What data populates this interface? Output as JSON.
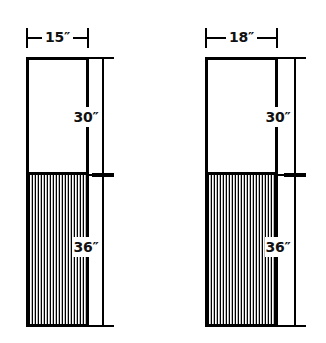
{
  "diagram": {
    "unit_symbol": "″",
    "colors": {
      "outline": "#000000",
      "background": "#ffffff",
      "hatch_dark": "#000000",
      "hatch_light": "#ffffff"
    },
    "figures": [
      {
        "id": "left-figure",
        "width_label": "15″",
        "width_value": 15,
        "upper_height_label": "30″",
        "upper_height_value": 30,
        "lower_height_label": "36″",
        "lower_height_value": 36,
        "upper_fill": "plain",
        "lower_fill": "vertical-hatch"
      },
      {
        "id": "right-figure",
        "width_label": "18″",
        "width_value": 18,
        "upper_height_label": "30″",
        "upper_height_value": 30,
        "lower_height_label": "36″",
        "lower_height_value": 36,
        "upper_fill": "plain",
        "lower_fill": "vertical-hatch"
      }
    ]
  }
}
